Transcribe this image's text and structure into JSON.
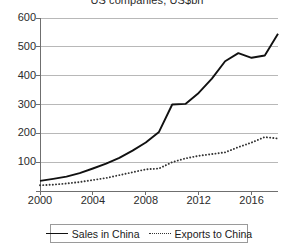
{
  "chart_data": {
    "type": "line",
    "title": "US companies, US$bn",
    "xlabel": "",
    "ylabel": "",
    "xlim": [
      2000,
      2018
    ],
    "ylim": [
      0,
      600
    ],
    "grid": true,
    "legend_position": "bottom",
    "x": [
      2000,
      2001,
      2002,
      2003,
      2004,
      2005,
      2006,
      2007,
      2008,
      2009,
      2010,
      2011,
      2012,
      2013,
      2014,
      2015,
      2016,
      2017,
      2018
    ],
    "y_ticks": [
      0,
      100,
      200,
      300,
      400,
      500,
      600
    ],
    "y_tick_labels": [
      "",
      "100",
      "200",
      "300",
      "400",
      "500",
      "600"
    ],
    "x_ticks": [
      2000,
      2004,
      2008,
      2012,
      2016
    ],
    "x_tick_labels": [
      "2000",
      "2004",
      "2008",
      "2012",
      "2016"
    ],
    "series": [
      {
        "name": "Sales in China",
        "style": "solid",
        "color": "#111111",
        "values": [
          35,
          42,
          50,
          62,
          78,
          95,
          115,
          140,
          168,
          205,
          300,
          302,
          340,
          390,
          450,
          478,
          462,
          470,
          545
        ]
      },
      {
        "name": "Exports to China",
        "style": "dotted",
        "color": "#333333",
        "values": [
          20,
          22,
          26,
          31,
          38,
          45,
          55,
          65,
          75,
          78,
          100,
          113,
          122,
          128,
          134,
          152,
          168,
          187,
          182
        ]
      }
    ]
  },
  "legend": {
    "items": [
      {
        "label": "Sales in China",
        "style": "solid"
      },
      {
        "label": "Exports to China",
        "style": "dotted"
      }
    ]
  },
  "colors": {
    "gridline": "#b8b8b8",
    "axis": "#6f6f6f",
    "series_solid": "#111111",
    "series_dotted": "#333333",
    "legend_border": "#9a9a9a"
  }
}
